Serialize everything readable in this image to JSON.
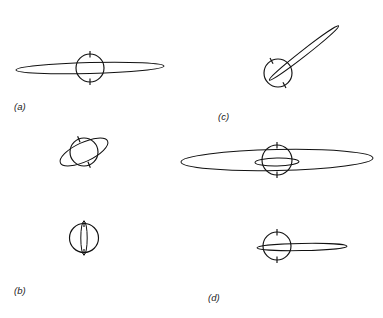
{
  "figure": {
    "kind": "orbital-configuration-diagram",
    "width": 383,
    "height": 318,
    "background_color": "#ffffff",
    "ink_color": "#111111",
    "label_color": "#222222",
    "panel_labels": [
      {
        "id": "a",
        "text": "(a)",
        "x": 14,
        "y": 110
      },
      {
        "id": "b",
        "text": "(b)",
        "x": 14,
        "y": 294
      },
      {
        "id": "c",
        "text": "(c)",
        "x": 218,
        "y": 120
      },
      {
        "id": "d",
        "text": "(d)",
        "x": 208,
        "y": 301
      }
    ],
    "panels": [
      {
        "id": "a",
        "label": "(a)",
        "diagrams": [
          {
            "name": "edge-on-eccentric-orbit",
            "body": {
              "cx": 90,
              "cy": 68,
              "r": 14
            },
            "axis_tilt_deg": 0,
            "orbits": [
              {
                "cx": 90,
                "cy": 68,
                "rx": 74,
                "ry": 5.5,
                "rotation_deg": -1.5
              }
            ]
          }
        ]
      },
      {
        "id": "b",
        "label": "(b)",
        "diagrams": [
          {
            "name": "tilted-ring-orbit",
            "body": {
              "cx": 84,
              "cy": 152,
              "r": 14
            },
            "axis_tilt_deg": -22,
            "orbits": [
              {
                "cx": 84,
                "cy": 152,
                "rx": 26,
                "ry": 9.5,
                "rotation_deg": -25
              }
            ]
          },
          {
            "name": "polar-narrow-orbit",
            "body": {
              "cx": 84,
              "cy": 238,
              "r": 14.5
            },
            "axis_tilt_deg": 0,
            "orbits": [
              {
                "cx": 84,
                "cy": 238,
                "rx": 17,
                "ry": 3.2,
                "rotation_deg": 90
              }
            ]
          }
        ]
      },
      {
        "id": "c",
        "label": "(c)",
        "diagrams": [
          {
            "name": "inclined-highly-eccentric-orbit",
            "body": {
              "cx": 278,
              "cy": 73,
              "r": 14
            },
            "axis_tilt_deg": -28,
            "orbits": [
              {
                "cx": 304,
                "cy": 53,
                "rx": 44,
                "ry": 3.0,
                "rotation_deg": -38
              }
            ]
          }
        ]
      },
      {
        "id": "d",
        "label": "(d)",
        "diagrams": [
          {
            "name": "wide-edge-on-orbit-with-inner-ring",
            "body": {
              "cx": 277,
              "cy": 160,
              "r": 15
            },
            "axis_tilt_deg": 0,
            "orbits": [
              {
                "cx": 277,
                "cy": 160,
                "rx": 96,
                "ry": 10.5,
                "rotation_deg": -1.2
              },
              {
                "cx": 277,
                "cy": 162,
                "rx": 22,
                "ry": 4.0,
                "rotation_deg": -1.0
              }
            ]
          },
          {
            "name": "offset-narrow-orbit",
            "body": {
              "cx": 277,
              "cy": 246,
              "r": 14
            },
            "axis_tilt_deg": 0,
            "orbits": [
              {
                "cx": 302,
                "cy": 247,
                "rx": 45,
                "ry": 3.6,
                "rotation_deg": -1.0
              }
            ]
          }
        ]
      }
    ]
  }
}
